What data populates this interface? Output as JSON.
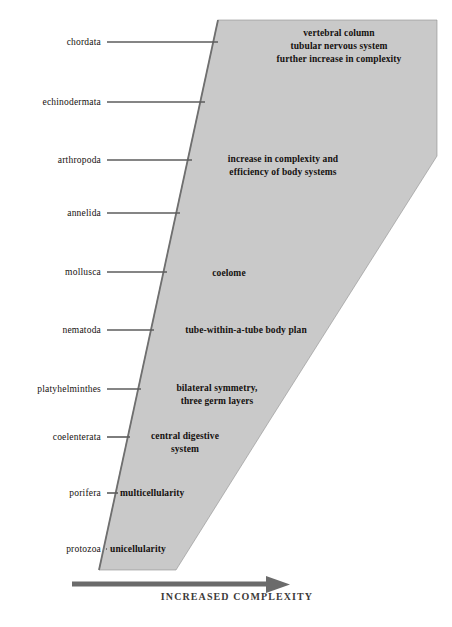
{
  "diagram": {
    "axis": {
      "caption": "INCREASED  COMPLEXITY",
      "arrow_color": "#6b6b6b",
      "arrow_direction": "right"
    },
    "wedge": {
      "fill_color": "#c9c9c9",
      "edge_color": "#6f6f6f"
    },
    "leader_line_color": "#5c5c5c",
    "phyla": [
      {
        "label": "chordata",
        "y": 42,
        "line_x1": 107,
        "line_x2": 218
      },
      {
        "label": "echinodermata",
        "y": 102,
        "line_x1": 107,
        "line_x2": 205
      },
      {
        "label": "arthropoda",
        "y": 160,
        "line_x1": 107,
        "line_x2": 192
      },
      {
        "label": "annelida",
        "y": 213,
        "line_x1": 107,
        "line_x2": 180
      },
      {
        "label": "mollusca",
        "y": 272,
        "line_x1": 107,
        "line_x2": 167
      },
      {
        "label": "nematoda",
        "y": 330,
        "line_x1": 107,
        "line_x2": 154
      },
      {
        "label": "platyhelminthes",
        "y": 389,
        "line_x1": 107,
        "line_x2": 141
      },
      {
        "label": "coelenterata",
        "y": 437,
        "line_x1": 107,
        "line_x2": 130
      },
      {
        "label": "porifera",
        "y": 493,
        "line_x1": 107,
        "line_x2": 118
      },
      {
        "label": "protozoa",
        "y": 549,
        "line_x1": 107,
        "line_x2": 106
      }
    ],
    "traits": [
      {
        "id": "vertebral-column-block",
        "lines": [
          "vertebral column",
          "tubular nervous system",
          "further increase in complexity"
        ],
        "x": 241,
        "y": 27,
        "width": 196,
        "align": "center"
      },
      {
        "id": "increase-complexity-block",
        "lines": [
          "increase in complexity and",
          "efficiency of body systems"
        ],
        "x": 185,
        "y": 153,
        "width": 196,
        "align": "center"
      },
      {
        "id": "coelome-block",
        "lines": [
          "coelome"
        ],
        "x": 169,
        "y": 267,
        "width": 120,
        "align": "center"
      },
      {
        "id": "tube-within-a-tube-block",
        "lines": [
          "tube-within-a-tube body plan"
        ],
        "x": 156,
        "y": 324,
        "width": 180,
        "align": "center"
      },
      {
        "id": "bilateral-symmetry-block",
        "lines": [
          "bilateral symmetry,",
          "three germ layers"
        ],
        "x": 142,
        "y": 382,
        "width": 150,
        "align": "center"
      },
      {
        "id": "central-digestive-block",
        "lines": [
          "central digestive",
          "system"
        ],
        "x": 130,
        "y": 430,
        "width": 110,
        "align": "center"
      },
      {
        "id": "multicellularity-block",
        "lines": [
          "multicellularity"
        ],
        "x": 120,
        "y": 487,
        "width": 110,
        "align": "left"
      },
      {
        "id": "unicellularity-block",
        "lines": [
          "unicellularity"
        ],
        "x": 110,
        "y": 543,
        "width": 110,
        "align": "left"
      }
    ]
  }
}
